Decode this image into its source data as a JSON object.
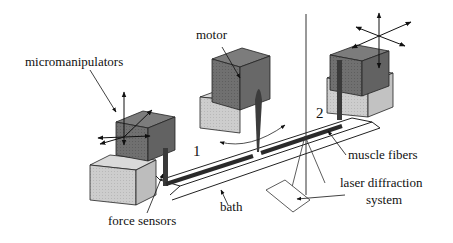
{
  "diagram": {
    "labels": {
      "micromanipulators": "micromanipulators",
      "motor": "motor",
      "muscle_fibers": "muscle fibers",
      "laser_line1": "laser diffraction",
      "laser_line2": "system",
      "bath": "bath",
      "force_sensors": "force sensors"
    },
    "markers": {
      "one": "1",
      "two": "2"
    },
    "colors": {
      "dark_block": "#6e6e6e",
      "dark_block_top": "#7c7c7c",
      "light_block": "#c9c9c9",
      "light_block_top": "#dadada",
      "fiber": "#2a2a2a",
      "line": "#222222"
    }
  }
}
